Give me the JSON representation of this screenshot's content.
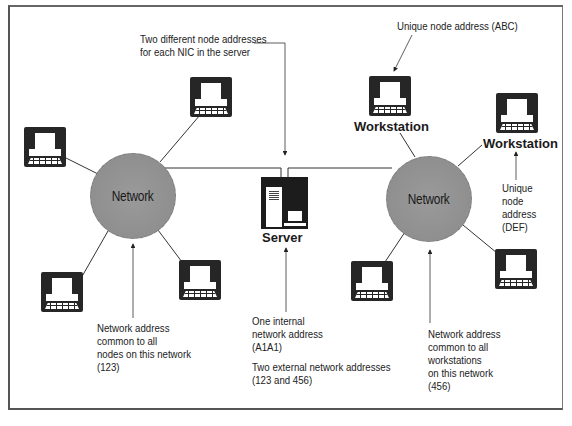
{
  "diagram": {
    "type": "network-addressing-diagram",
    "networks": [
      {
        "id": "left",
        "label": "Network",
        "address": "123"
      },
      {
        "id": "right",
        "label": "Network",
        "address": "456"
      }
    ],
    "server": {
      "label": "Server",
      "internal_address": "A1A1",
      "external_addresses": [
        "123",
        "456"
      ]
    },
    "workstations": [
      {
        "network": "left",
        "label": ""
      },
      {
        "network": "left",
        "label": ""
      },
      {
        "network": "left",
        "label": ""
      },
      {
        "network": "left",
        "label": ""
      },
      {
        "network": "right",
        "label": "Workstation",
        "node_address": "ABC"
      },
      {
        "network": "right",
        "label": "Workstation",
        "node_address": "DEF"
      },
      {
        "network": "right",
        "label": ""
      },
      {
        "network": "right",
        "label": ""
      }
    ],
    "labels": {
      "network_left": "Network",
      "network_right": "Network",
      "server": "Server",
      "workstation_abc": "Workstation",
      "workstation_def": "Workstation"
    },
    "annotations": {
      "nic_addresses": "Two different node addresses\nfor each NIC in the server",
      "unique_abc": "Unique node address (ABC)",
      "unique_def": "Unique\nnode\naddress\n(DEF)",
      "left_network_address": "Network address\ncommon to all\nnodes on this network\n(123)",
      "right_network_address": "Network address\ncommon to all\nworkstations\non this network\n(456)",
      "internal_address": "One internal\nnetwork address\n(A1A1)",
      "external_addresses": "Two external network addresses\n(123 and 456)"
    },
    "colors": {
      "network_fill": "#8f8f8f",
      "icon_fill": "#262626",
      "line": "#333333",
      "background": "#ffffff"
    }
  }
}
